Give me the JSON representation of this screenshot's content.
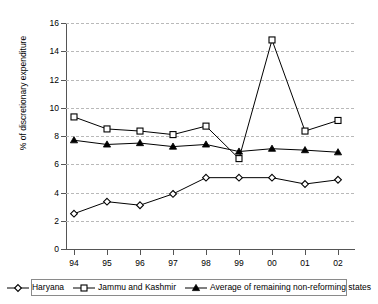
{
  "chart_data": {
    "type": "line",
    "title": "",
    "xlabel": "",
    "ylabel": "% of discretionary expenditure",
    "x": [
      "94",
      "95",
      "96",
      "97",
      "98",
      "99",
      "00",
      "01",
      "02"
    ],
    "categories": [
      "94",
      "95",
      "96",
      "97",
      "98",
      "99",
      "00",
      "01",
      "02"
    ],
    "ylim": [
      0,
      16
    ],
    "yticks": [
      0,
      2,
      4,
      6,
      8,
      10,
      12,
      14,
      16
    ],
    "ytick_labels": [
      "0",
      "2",
      "4",
      "6",
      "8",
      "10",
      "12",
      "14",
      "16"
    ],
    "grid": "horizontal-dashed",
    "legend_position": "bottom",
    "series": [
      {
        "name": "Haryana",
        "marker": "open-diamond",
        "color": "#000000",
        "values": [
          2.5,
          3.35,
          3.1,
          3.9,
          5.05,
          5.05,
          5.05,
          4.6,
          4.9
        ]
      },
      {
        "name": "Jammu and Kashmir",
        "marker": "open-square",
        "color": "#000000",
        "values": [
          9.35,
          8.5,
          8.35,
          8.1,
          8.7,
          6.4,
          14.8,
          8.35,
          9.1
        ]
      },
      {
        "name": "Average of remaining non-reforming states",
        "marker": "filled-triangle",
        "color": "#000000",
        "values": [
          7.7,
          7.4,
          7.5,
          7.25,
          7.4,
          6.9,
          7.1,
          7.0,
          6.85
        ]
      }
    ]
  },
  "legend": {
    "items": [
      {
        "label": "Haryana",
        "marker": "open-diamond"
      },
      {
        "label": "Jammu and Kashmir",
        "marker": "open-square"
      },
      {
        "label": "Average of remaining non-reforming states",
        "marker": "filled-triangle"
      }
    ]
  }
}
